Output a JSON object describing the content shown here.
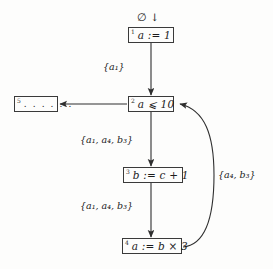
{
  "diagram": {
    "title_mark": "∅ ↓",
    "nodes": [
      {
        "id": "1",
        "label": "a := 1",
        "kind": "assignment"
      },
      {
        "id": "2",
        "label": "a ⩽ 10",
        "kind": "condition"
      },
      {
        "id": "3",
        "label": "b := c + 1",
        "kind": "assignment"
      },
      {
        "id": "4",
        "label": "a := b × 3",
        "kind": "assignment"
      },
      {
        "id": "5",
        "label": ". . . . . .",
        "kind": "ellipsis"
      }
    ],
    "edge_labels": [
      {
        "id": "e1",
        "from": "1",
        "to": "2",
        "text": "{a₁}"
      },
      {
        "id": "e2",
        "from": "2",
        "to": "3",
        "text": "{a₁, a₄, b₃}"
      },
      {
        "id": "e3",
        "from": "3",
        "to": "4",
        "text": "{a₁, a₄, b₃}"
      },
      {
        "id": "e4",
        "from": "4",
        "to": "2",
        "text": "{a₄, b₃}"
      }
    ],
    "colors": {
      "background": "#fdfdfc",
      "stroke": "#3a3a3a",
      "text": "#1c1c1c"
    }
  }
}
